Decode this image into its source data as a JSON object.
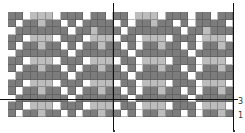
{
  "diagram": {
    "type": "weaving-draft",
    "columns": 30,
    "rows": 14,
    "colors": {
      "D": "#7c7c7c",
      "L": "#bdbdbd",
      "W": "#ffffff",
      "line": "#111111"
    },
    "grid": [
      "DDWLLLWDDDWDDWDDWLLLWDDDWDDWDD",
      "DWDDLDDWDWDDDDWDWDDLDDWDWDDDDW",
      "WDDDDDDDWDDLDDDWDDDDDDDWDDLDDD",
      "DDWLLLWDDDWLLLWDDWLLLWDDDWLLLW",
      "DWDDLDDWDWDDLDDWDWDDLDDWDWDDLD",
      "WDDDDDDDWDDDDDDDWDDDDDDDWDDDDD",
      "DDWLLLWDDDWLLLWDDWLLLWDDDWLLLW",
      "DWDDLDDWDWDDLDDWDWDDLDDWDWDDLD",
      "WDDDDDDDWDDDDDDDWDDDDDDDWDDDDD",
      "DDWLLLWDDDWLLLWDDWLLLWDDDWLLLW",
      "DWDDLDDWDWDDLDDWDWDDLDDWDWDDLD",
      "WDDDDDDDWDDDDDDDWDDDDDDDWDDDDD",
      "DDWLLLWDDDWLLLWDDWLLLWDDDWLLLW",
      "DWDDLDDWDWDDLDDWDWDDLDDWDWDDLD"
    ],
    "labels": {
      "row_marker_upper": "3",
      "row_marker_lower": "1"
    }
  }
}
